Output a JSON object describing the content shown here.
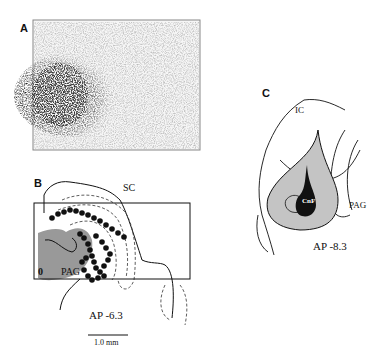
{
  "figure": {
    "panels": [
      {
        "id": "A",
        "label": "A",
        "content": "photomicrograph of labeling"
      },
      {
        "id": "B",
        "label": "B",
        "section": "AP -6.3",
        "regions": [
          "SC",
          "PAG"
        ],
        "scale_bar": "1.0 mm"
      },
      {
        "id": "C",
        "label": "C",
        "section": "AP -8.3",
        "regions": [
          "IC",
          "PAG",
          "CnF"
        ]
      }
    ]
  },
  "panelA": {
    "label": "A"
  },
  "panelB": {
    "label": "B",
    "sc": "SC",
    "pag": "PAG",
    "ap": "AP -6.3",
    "scale": "1.0 mm",
    "marker": "0"
  },
  "panelC": {
    "label": "C",
    "ic": "IC",
    "pag": "PAG",
    "cnf": "CnF",
    "ap": "AP -8.3"
  },
  "colors": {
    "injection_gray": "#9a9a9a",
    "light_gray": "#c4c4c4",
    "dark": "#111111"
  }
}
